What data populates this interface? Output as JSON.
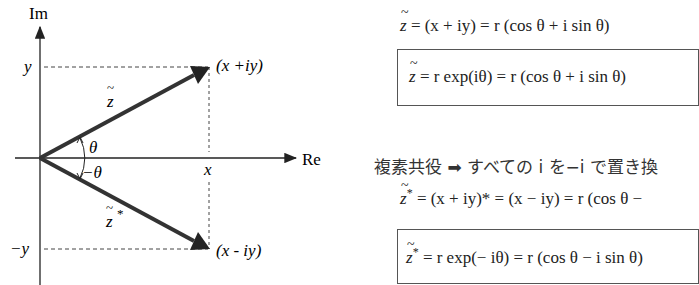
{
  "diagram": {
    "axes": {
      "real_label": "Re",
      "imag_label": "Im"
    },
    "ticks": {
      "x": "x",
      "y": "y",
      "neg_y": "−y"
    },
    "points": {
      "z": "(x +iy)",
      "z_conj": "(x - iy)"
    },
    "vectors": {
      "z_label": "z",
      "z_conj_label": "z",
      "z_conj_sup": "*"
    },
    "angles": {
      "pos": "θ",
      "neg": "−θ"
    },
    "colors": {
      "line": "#333333",
      "dash": "#444444"
    }
  },
  "equations": {
    "eq1": {
      "lhs": "z",
      "rhs": "= (x + iy) = r (cos θ + i sin θ)"
    },
    "eq2_boxed": {
      "lhs": "z",
      "rhs": "= r exp(iθ) = r (cos θ + i sin θ)"
    },
    "conj_rule": {
      "text": "複素共役 ➡ すべての i を−i で置き換"
    },
    "eq3": {
      "lhs": "z",
      "sup": "*",
      "rhs": "= (x + iy)* = (x − iy) = r (cos θ −"
    },
    "eq4_boxed": {
      "lhs": "z",
      "sup": "*",
      "rhs": "= r exp(− iθ) = r (cos θ − i sin θ)"
    }
  }
}
